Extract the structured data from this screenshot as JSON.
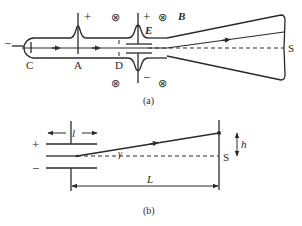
{
  "figure_a": {
    "caption": "(a)",
    "labels": {
      "cathode": "C",
      "anode_a": "A",
      "anode_d": "D",
      "screen": "S",
      "field_e": "E",
      "field_b": "B",
      "plus_a": "+",
      "plus_plate": "+",
      "minus_plate": "−",
      "minus_cathode": "−"
    },
    "magnetic_field_symbol": "⊗"
  },
  "figure_b": {
    "caption": "(b)",
    "labels": {
      "plate_length": "l",
      "plus": "+",
      "minus": "−",
      "angle": "γ",
      "distance": "L",
      "deflection": "h",
      "screen": "S"
    }
  },
  "colors": {
    "line": "#2a2a2a",
    "background": "#ffffff"
  }
}
